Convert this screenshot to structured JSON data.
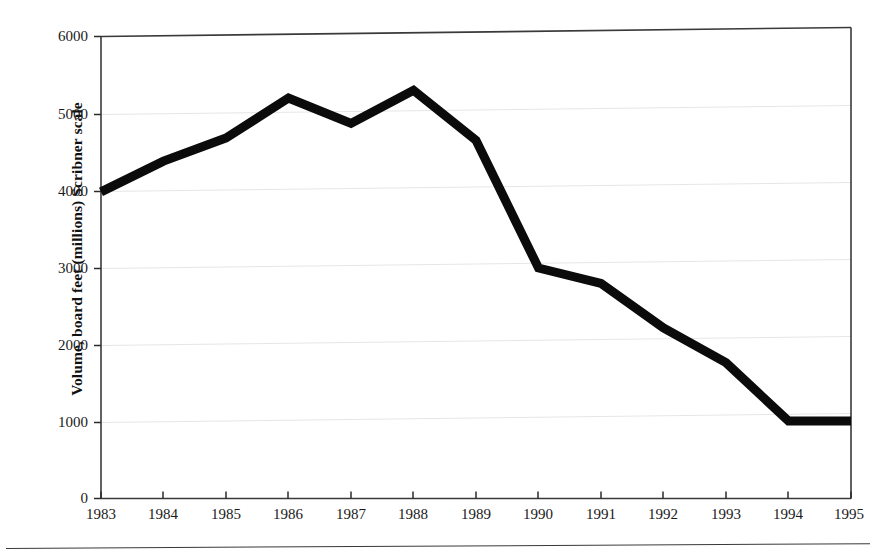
{
  "figure": {
    "name": "timber-harvest-volume-line-chart",
    "background_color": "#ffffff",
    "line_color": "#0b0b0b",
    "axis_color": "#2b2b2b",
    "grid_color": "#e4e4e4"
  },
  "chart_data": {
    "type": "line",
    "title": "",
    "xlabel": "",
    "ylabel": "Volume, board feet (millions) Scribner scale",
    "categories": [
      "1983",
      "1984",
      "1985",
      "1986",
      "1987",
      "1988",
      "1989",
      "1990",
      "1991",
      "1992",
      "1993",
      "1994",
      "1995"
    ],
    "x": [
      1983,
      1984,
      1985,
      1986,
      1987,
      1988,
      1989,
      1990,
      1991,
      1992,
      1993,
      1994,
      1995
    ],
    "values": [
      3980,
      4380,
      4680,
      5200,
      4870,
      5300,
      4650,
      2990,
      2790,
      2210,
      1760,
      1000,
      1000
    ],
    "series": [
      {
        "name": "Volume, board feet (millions) Scribner scale",
        "values": [
          3980,
          4380,
          4680,
          5200,
          4870,
          5300,
          4650,
          2990,
          2790,
          2210,
          1760,
          1000,
          1000
        ]
      }
    ],
    "xlim": [
      1983,
      1995
    ],
    "ylim": [
      0,
      6000
    ],
    "ytick_labels": [
      "0",
      "1000",
      "2000",
      "3000",
      "4000",
      "5000",
      "6000"
    ],
    "yticks": [
      0,
      1000,
      2000,
      3000,
      4000,
      5000,
      6000
    ],
    "xtick_labels": [
      "1983",
      "1984",
      "1985",
      "1986",
      "1987",
      "1988",
      "1989",
      "1990",
      "1991",
      "1992",
      "1993",
      "1994",
      "1995"
    ],
    "grid": "horizontal",
    "legend": "none"
  },
  "axis_labels": {
    "y_title": "Volume, board feet (millions) Scribner scale",
    "y_0": "0",
    "y_1000": "1000",
    "y_2000": "2000",
    "y_3000": "3000",
    "y_4000": "4000",
    "y_5000": "5000",
    "y_6000": "6000",
    "x_1983": "1983",
    "x_1984": "1984",
    "x_1985": "1985",
    "x_1986": "1986",
    "x_1987": "1987",
    "x_1988": "1988",
    "x_1989": "1989",
    "x_1990": "1990",
    "x_1991": "1991",
    "x_1992": "1992",
    "x_1993": "1993",
    "x_1994": "1994",
    "x_1995": "1995"
  }
}
